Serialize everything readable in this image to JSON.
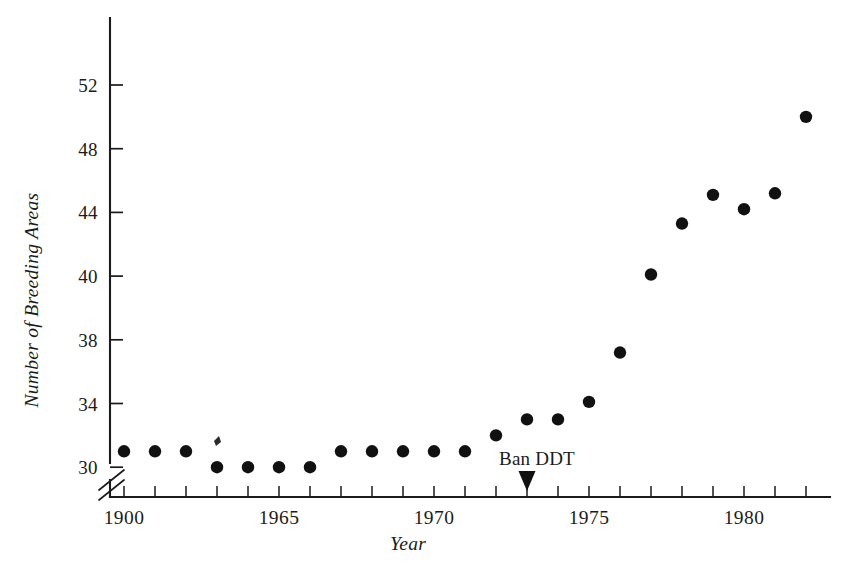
{
  "figure": {
    "background_color": "#ffffff",
    "ink_color": "#1b1b1b",
    "point_color": "#111111"
  },
  "chart_data": {
    "type": "scatter",
    "title": "",
    "subtitle": "",
    "xlabel": "Year",
    "ylabel": "Number of Breeding Areas",
    "grid": false,
    "legend": false,
    "legend_position": "none",
    "xlim": [
      1959.5,
      1982.7
    ],
    "ylim": [
      29.2,
      53.6
    ],
    "y_axis_break": true,
    "y_axis_break_below": 30,
    "x_tick_labels": [
      "1900",
      "1965",
      "1970",
      "1975",
      "1980"
    ],
    "x_tick_label_values": [
      1960,
      1965,
      1970,
      1975,
      1980
    ],
    "x_minor_tick_values": [
      1960,
      1961,
      1962,
      1963,
      1964,
      1965,
      1966,
      1967,
      1968,
      1969,
      1970,
      1971,
      1972,
      1973,
      1974,
      1975,
      1976,
      1977,
      1978,
      1979,
      1980,
      1981,
      1982
    ],
    "y_tick_labels": [
      "52",
      "48",
      "44",
      "40",
      "38",
      "34",
      "30"
    ],
    "y_tick_label_values": [
      52,
      48,
      44,
      40,
      38,
      34,
      30
    ],
    "x": [
      1960,
      1961,
      1962,
      1963,
      1963,
      1964,
      1965,
      1966,
      1967,
      1968,
      1969,
      1970,
      1971,
      1972,
      1973,
      1974,
      1975,
      1976,
      1977,
      1978,
      1979,
      1980,
      1981,
      1982
    ],
    "y": [
      31,
      31,
      31,
      31.6,
      30,
      30,
      30,
      30,
      31,
      31,
      31,
      31,
      31,
      32,
      33,
      33,
      34.1,
      37.2,
      40.1,
      43.3,
      45.1,
      44.2,
      45.2,
      50
    ],
    "points": [
      {
        "year": 1960,
        "value": 31
      },
      {
        "year": 1961,
        "value": 31
      },
      {
        "year": 1962,
        "value": 31
      },
      {
        "year": 1963,
        "value": 30
      },
      {
        "year": 1964,
        "value": 30
      },
      {
        "year": 1965,
        "value": 30
      },
      {
        "year": 1966,
        "value": 30
      },
      {
        "year": 1967,
        "value": 31
      },
      {
        "year": 1968,
        "value": 31
      },
      {
        "year": 1969,
        "value": 31
      },
      {
        "year": 1970,
        "value": 31
      },
      {
        "year": 1971,
        "value": 31
      },
      {
        "year": 1972,
        "value": 32
      },
      {
        "year": 1973,
        "value": 33
      },
      {
        "year": 1974,
        "value": 33
      },
      {
        "year": 1975,
        "value": 34.1
      },
      {
        "year": 1976,
        "value": 37.2
      },
      {
        "year": 1977,
        "value": 40.1
      },
      {
        "year": 1978,
        "value": 43.3
      },
      {
        "year": 1979,
        "value": 45.1
      },
      {
        "year": 1980,
        "value": 44.2
      },
      {
        "year": 1981,
        "value": 45.2
      },
      {
        "year": 1982,
        "value": 50
      }
    ],
    "annotations": [
      {
        "text": "Ban DDT",
        "year": 1973,
        "marker": "down-triangle",
        "position": "above-x-axis"
      }
    ]
  }
}
